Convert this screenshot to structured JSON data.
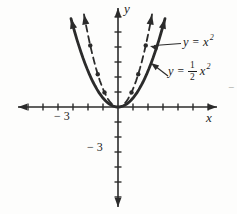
{
  "figure": {
    "background_color": "#fdfdfc",
    "ink_color": "#2b2b2b",
    "stray_mark": "−"
  },
  "chart_data": {
    "type": "line",
    "title": "",
    "xlabel": "x",
    "ylabel": "y",
    "axes": {
      "x_axis_letter": "x",
      "y_axis_letter": "y",
      "x_tick_interval": 1,
      "x_ticks_shown": 6,
      "y_ticks_shown": 6,
      "x_labeled_tick": {
        "value": -3,
        "label": "− 3"
      },
      "y_labeled_tick": {
        "value": -3,
        "label": "− 3"
      },
      "arrows": "both-ends",
      "grid": "off"
    },
    "series": [
      {
        "name": "y = x^2",
        "label_parts": {
          "lhs": "y",
          "eq": "=",
          "base": "x",
          "sup": "2"
        },
        "style": "dashed",
        "coeff": 1,
        "marker_points_x": [
          -1.85,
          -1.35,
          -0.9,
          0.9,
          1.35,
          1.85
        ],
        "points": [
          [
            -2,
            4
          ],
          [
            -1.5,
            2.25
          ],
          [
            -1,
            1
          ],
          [
            0,
            0
          ],
          [
            1,
            1
          ],
          [
            1.5,
            2.25
          ],
          [
            2,
            4
          ]
        ]
      },
      {
        "name": "y = (1/2)x^2",
        "label_parts": {
          "lhs": "y",
          "eq": "=",
          "num": "1",
          "den": "2",
          "base": "x",
          "sup": "2"
        },
        "style": "solid",
        "coeff": 0.5,
        "points": [
          [
            -3,
            4.5
          ],
          [
            -2,
            2
          ],
          [
            -1,
            0.5
          ],
          [
            0,
            0
          ],
          [
            1,
            0.5
          ],
          [
            2,
            2
          ],
          [
            3,
            4.5
          ]
        ]
      }
    ],
    "layout": {
      "origin_px": {
        "x": 118,
        "y": 107
      },
      "x_scale_px": 15,
      "y_scale_px": 18,
      "y_tick_spacing_px": 15,
      "x_axis_px": {
        "left": 18,
        "right": 217
      },
      "y_axis_px": {
        "top": 8,
        "bottom": 207
      },
      "curve_half_width_px": {
        "dashed": 34,
        "solid": 47
      },
      "annotations": [
        {
          "target": "dashed-curve",
          "line": [
            [
              181,
              43.5
            ],
            [
              154,
              45.5
            ]
          ],
          "tip": [
            150,
            46
          ],
          "angle": 195
        },
        {
          "target": "solid-curve",
          "line": [
            [
              168,
              76
            ],
            [
              155,
              66
            ]
          ],
          "tip": [
            151,
            63
          ],
          "angle": 217
        }
      ]
    }
  }
}
